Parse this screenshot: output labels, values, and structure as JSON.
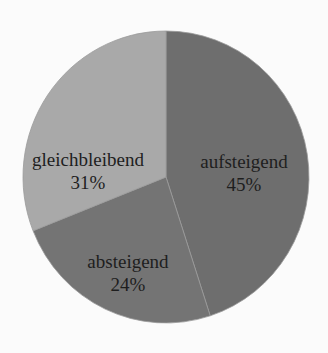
{
  "chart_data": {
    "type": "pie",
    "title": "",
    "start_angle_deg": 0,
    "direction": "clockwise",
    "slices": [
      {
        "label": "aufsteigend",
        "value": 45,
        "display": "45%",
        "color": "#6e6e6e"
      },
      {
        "label": "absteigend",
        "value": 24,
        "display": "24%",
        "color": "#747474"
      },
      {
        "label": "gleichbleibend",
        "value": 31,
        "display": "31%",
        "color": "#a9a9a9"
      }
    ],
    "legend": "none",
    "labels_inside": true
  },
  "labels": {
    "aufsteigend": {
      "name": "aufsteigend",
      "pct": "45%"
    },
    "absteigend": {
      "name": "absteigend",
      "pct": "24%"
    },
    "gleichbleibend": {
      "name": "gleichbleibend",
      "pct": "31%"
    }
  }
}
